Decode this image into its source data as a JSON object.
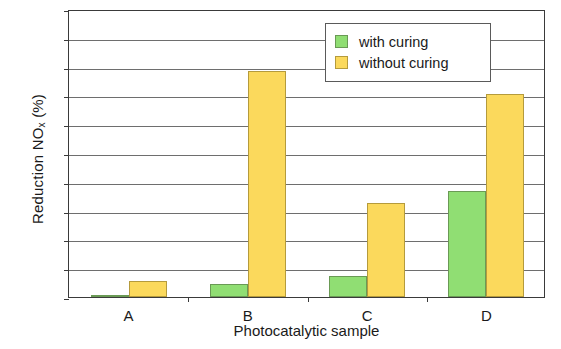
{
  "chart_data": {
    "type": "bar",
    "title": "",
    "xlabel": "Photocatalytic sample",
    "ylabel": "Reduction NOx (%)",
    "ylabel_prefix": "Reduction NO",
    "ylabel_sub": "x",
    "ylabel_suffix": " (%)",
    "categories": [
      "A",
      "B",
      "C",
      "D"
    ],
    "series": [
      {
        "name": "with curing",
        "color": "#90de73",
        "values": [
          0.2,
          2.3,
          3.7,
          18.4
        ]
      },
      {
        "name": "without curing",
        "color": "#fbd95c",
        "values": [
          2.8,
          39.3,
          16.4,
          35.2
        ]
      }
    ],
    "ylim": [
      0,
      50
    ],
    "ytick_step": 5,
    "yticks": [
      0,
      5,
      10,
      15,
      20,
      25,
      30,
      35,
      40,
      45,
      50
    ],
    "ytick_labels": [
      "0",
      "5",
      "10",
      "15",
      "20",
      "25",
      "30",
      "35",
      "40",
      "45",
      "50"
    ],
    "grid": true,
    "grid_axis": "y",
    "legend_position": "top-right"
  },
  "legend": {
    "items": [
      {
        "label": "with curing"
      },
      {
        "label": "without curing"
      }
    ]
  }
}
